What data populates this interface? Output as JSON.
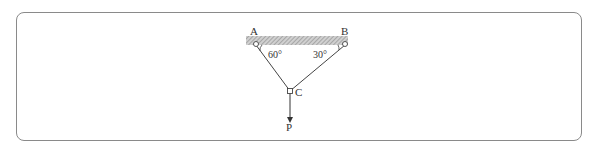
{
  "diagram": {
    "type": "statics-two-cable-support",
    "points": {
      "A": {
        "label": "A"
      },
      "B": {
        "label": "B"
      },
      "C": {
        "label": "C"
      }
    },
    "angles": {
      "at_A": "60°",
      "at_B": "30°"
    },
    "load": {
      "label": "P"
    }
  }
}
